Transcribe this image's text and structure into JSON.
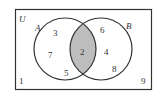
{
  "diagram": {
    "type": "venn",
    "universe_label": "U",
    "sets": [
      {
        "name": "A",
        "only": [
          3,
          7,
          5
        ]
      },
      {
        "name": "B",
        "only": [
          6,
          4,
          8
        ]
      }
    ],
    "intersection": [
      2
    ],
    "outside": [
      1,
      9
    ],
    "shaded_region": "A ∩ B",
    "colors": {
      "shade": "#bdbdbd",
      "stroke": "#333333",
      "background": "#ffffff"
    }
  },
  "labels": {
    "U": "U",
    "A": "A",
    "B": "B",
    "a1": "3",
    "a2": "7",
    "a3": "5",
    "ab": "2",
    "b1": "6",
    "b2": "4",
    "b3": "8",
    "o1": "1",
    "o2": "9"
  }
}
